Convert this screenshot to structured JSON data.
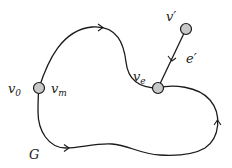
{
  "diagram": {
    "graph_label": "G",
    "colors": {
      "stroke": "#1a1a1a",
      "node_fill": "#c8c8c8",
      "background": "#ffffff"
    },
    "nodes": [
      {
        "id": "v0_vm",
        "x": 39,
        "y": 88,
        "labels": [
          {
            "base": "v",
            "sub": "0",
            "x": 8,
            "y": 93
          },
          {
            "base": "v",
            "sub": "m",
            "x": 50,
            "y": 93
          }
        ]
      },
      {
        "id": "ve",
        "x": 158,
        "y": 88,
        "labels": [
          {
            "base": "v",
            "sub": "e",
            "x": 133,
            "y": 80
          }
        ]
      },
      {
        "id": "vprime",
        "x": 186,
        "y": 29,
        "labels": [
          {
            "base": "v",
            "prime": "′",
            "x": 166,
            "y": 20
          }
        ]
      }
    ],
    "edges": [
      {
        "id": "cycle-top",
        "from": "v0_vm",
        "to": "ve",
        "arrow": "right"
      },
      {
        "id": "cycle-right",
        "from": "ve",
        "to": "ve",
        "arrow": "up"
      },
      {
        "id": "cycle-bottom",
        "from": "ve",
        "to": "v0_vm",
        "arrow": "right"
      },
      {
        "id": "e-prime",
        "from": "vprime",
        "to": "ve",
        "label": "e′",
        "arrow": "down"
      }
    ],
    "text": {
      "v0_base": "v",
      "v0_sub": "0",
      "vm_base": "v",
      "vm_sub": "m",
      "ve_base": "v",
      "ve_sub": "e",
      "vprime": "v′",
      "eprime": "e′",
      "G": "G"
    }
  }
}
